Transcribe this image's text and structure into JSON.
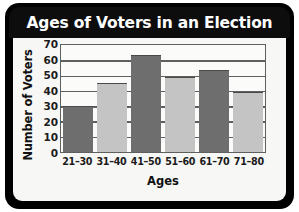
{
  "chart_data": {
    "type": "bar",
    "title": "Ages of Voters in an Election",
    "xlabel": "Ages",
    "ylabel": "Number of Voters",
    "categories": [
      "21–30",
      "31–40",
      "41–50",
      "51–60",
      "61–70",
      "71–80"
    ],
    "values": [
      30,
      45,
      64,
      49,
      54,
      39
    ],
    "ylim": [
      0,
      70
    ],
    "ytick_step": 10,
    "yticks": [
      70,
      60,
      50,
      40,
      30,
      20,
      10,
      0
    ],
    "grid": true,
    "legend": "none",
    "bar_colors": [
      "#6e6e6e",
      "#c4c4c4",
      "#6e6e6e",
      "#c4c4c4",
      "#6e6e6e",
      "#c4c4c4"
    ],
    "series": [
      {
        "name": "Number of Voters",
        "values": [
          30,
          45,
          64,
          49,
          54,
          39
        ]
      }
    ]
  },
  "style": {
    "title_bar_color": "#0d0d0d",
    "title_text_color": "#ffffff",
    "card_background": "#f7f7f5",
    "plot_background": "#fbfbf9",
    "axis_color": "#5f5f5f",
    "dark_bar": "#6e6e6e",
    "light_bar": "#c4c4c4"
  }
}
